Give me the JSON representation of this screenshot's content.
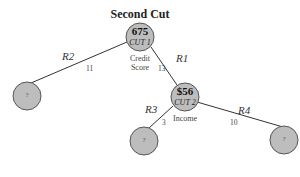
{
  "diagram": {
    "title": "Second Cut",
    "root": {
      "value": "675",
      "cut": "CUT 1",
      "label_line1": "Credit",
      "label_line2": "Score"
    },
    "node2": {
      "value": "$56",
      "cut": "CUT 2",
      "label": "Income"
    },
    "edges": [
      {
        "region": "R2",
        "count": "11"
      },
      {
        "region": "R1",
        "count": "13"
      },
      {
        "region": "R3",
        "count": "3"
      },
      {
        "region": "R4",
        "count": "10"
      }
    ],
    "leaves": [
      {
        "label": "?"
      },
      {
        "label": "?"
      },
      {
        "label": "?"
      }
    ],
    "colors": {
      "node_fill": "#bdbdbd",
      "node_stroke": "#555555",
      "line": "#333333"
    }
  }
}
